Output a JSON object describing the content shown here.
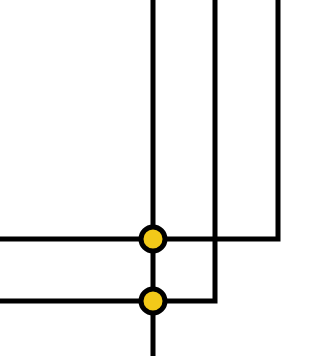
{
  "diagram": {
    "type": "wire-junction",
    "colors": {
      "wire": "#000000",
      "junction_fill": "#F2C919",
      "junction_stroke": "#000000",
      "background": "#FFFFFF"
    },
    "wires": [
      {
        "id": "v1",
        "points": [
          [
            153,
            0
          ],
          [
            153,
            356
          ]
        ]
      },
      {
        "id": "v2-h2",
        "points": [
          [
            215,
            0
          ],
          [
            215,
            301
          ],
          [
            0,
            301
          ]
        ]
      },
      {
        "id": "v3-h1",
        "points": [
          [
            278,
            0
          ],
          [
            278,
            239
          ],
          [
            0,
            239
          ]
        ]
      }
    ],
    "junctions": [
      {
        "id": "j1",
        "x": 153,
        "y": 239,
        "r": 12
      },
      {
        "id": "j2",
        "x": 153,
        "y": 301,
        "r": 12
      }
    ]
  }
}
